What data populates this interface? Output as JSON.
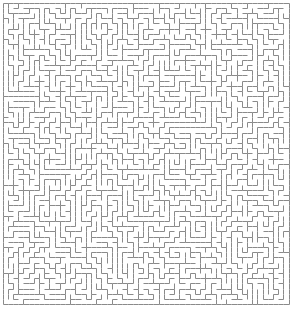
{
  "page": {
    "type": "maze-puzzle"
  },
  "canvas": {
    "width": 295,
    "height": 312,
    "background_color": "#ffffff"
  },
  "maze": {
    "name": "rectangular-perfect-maze",
    "columns": 55,
    "rows": 58,
    "cell_size": 5.2,
    "origin_x": 2.5,
    "origin_y": 2.5,
    "wall_color": "#8a8a8a",
    "wall_thickness": 1,
    "background_color": "#ffffff",
    "border": "closed-rectangle",
    "algorithm": "depth-first-backtracker",
    "seed": 20240607
  },
  "chart_data": {
    "type": "maze",
    "grid": {
      "columns": 55,
      "rows": 58
    },
    "entrance": null,
    "exit": null,
    "solution_path": null,
    "legend": [],
    "xlabel": "",
    "ylabel": ""
  }
}
